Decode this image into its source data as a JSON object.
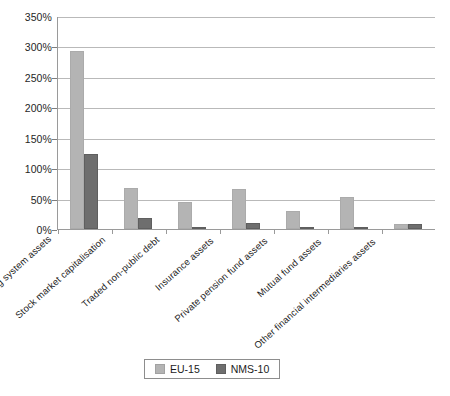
{
  "chart_data": {
    "type": "bar",
    "title": "",
    "xlabel": "",
    "ylabel": "",
    "ylim": [
      0,
      350
    ],
    "ytick_values": [
      0,
      50,
      100,
      150,
      200,
      250,
      300,
      350
    ],
    "ytick_labels": [
      "0%",
      "50%",
      "100%",
      "150%",
      "200%",
      "250%",
      "300%",
      "350%"
    ],
    "grid": true,
    "legend_position": "bottom-center",
    "categories": [
      "Banking system assets",
      "Stock market capitalisation",
      "Traded non-public debt",
      "Insurance assets",
      "Private pension fund assets",
      "Mutual fund assets",
      "Other financial intermediaries assets"
    ],
    "series": [
      {
        "name": "EU-15",
        "color": "#b4b4b4",
        "values": [
          292,
          67,
          45,
          66,
          30,
          53,
          8
        ]
      },
      {
        "name": "NMS-10",
        "color": "#6e6e6e",
        "values": [
          123,
          18,
          4,
          10,
          4,
          4,
          9
        ]
      }
    ]
  },
  "legend": {
    "items": [
      {
        "label": "EU-15"
      },
      {
        "label": "NMS-10"
      }
    ]
  }
}
